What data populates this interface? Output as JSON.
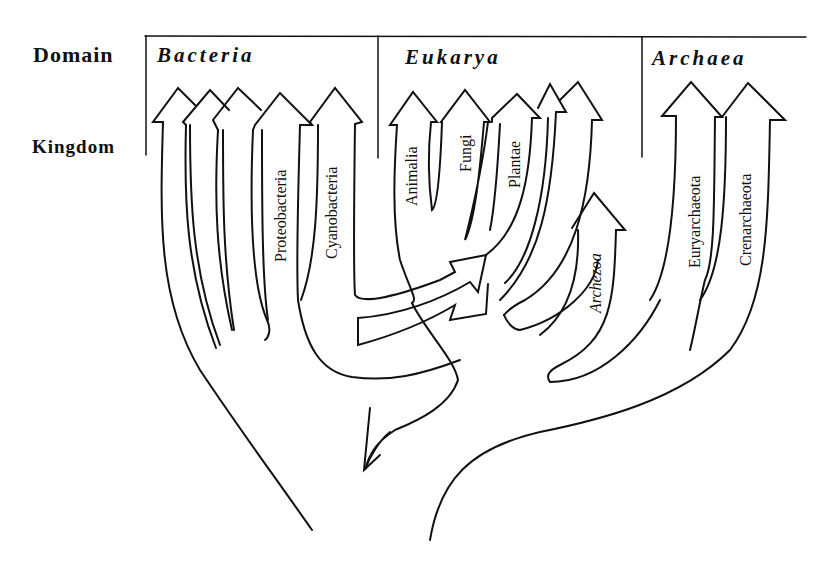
{
  "row_labels": {
    "domain": "Domain",
    "kingdom": "Kingdom"
  },
  "domains": [
    {
      "name": "Bacteria",
      "kingdoms": [
        "",
        "",
        "",
        "Proteobacteria",
        "Cyanobacteria"
      ]
    },
    {
      "name": "Eukarya",
      "kingdoms": [
        "Animalia",
        "Fungi",
        "Plantae",
        "",
        "",
        "Archezoa"
      ]
    },
    {
      "name": "Archaea",
      "kingdoms": [
        "Euryarchaeota",
        "Crenarchaeota"
      ]
    }
  ],
  "labels": {
    "proteobacteria": "Proteobacteria",
    "cyanobacteria": "Cyanobacteria",
    "animalia": "Animalia",
    "fungi": "Fungi",
    "plantae": "Plantae",
    "archezoa": "Archezoa",
    "euryarchaeota": "Euryarchaeota",
    "crenarchaeota": "Crenarchaeota"
  },
  "colors": {
    "ink": "#111111",
    "paper": "#ffffff"
  }
}
